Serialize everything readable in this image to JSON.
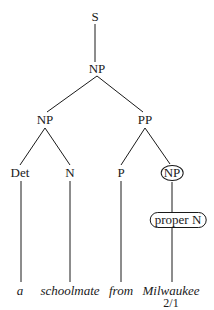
{
  "tree": {
    "root": "S",
    "np_top": "NP",
    "np_left": "NP",
    "pp": "PP",
    "det": "Det",
    "n": "N",
    "p": "P",
    "np_right": "NP",
    "proper_n": "proper N"
  },
  "words": [
    "a",
    "schoolmate",
    "from",
    "Milwaukee"
  ],
  "caption": "2/1"
}
